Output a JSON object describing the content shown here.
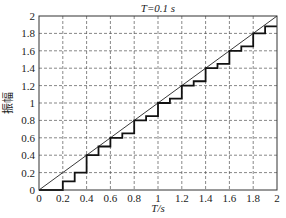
{
  "chart_data": {
    "type": "line",
    "title": "T=0.1 s",
    "xlabel": "T/s",
    "ylabel": "振幅",
    "xlim": [
      0,
      2
    ],
    "ylim": [
      0,
      2
    ],
    "grid": true,
    "x_ticks": [
      "0",
      "0.2",
      "0.4",
      "0.6",
      "0.8",
      "1",
      "1.2",
      "1.4",
      "1.6",
      "1.8",
      "2"
    ],
    "y_ticks": [
      "0",
      "0.2",
      "0.4",
      "0.6",
      "0.8",
      "1",
      "1.2",
      "1.4",
      "1.6",
      "1.8",
      "2"
    ],
    "series": [
      {
        "name": "input (ramp)",
        "style": "thin line",
        "x": [
          0,
          2
        ],
        "y": [
          0,
          2
        ]
      },
      {
        "name": "sampled output (staircase)",
        "style": "thick step",
        "x": [
          0,
          0.2,
          0.3,
          0.4,
          0.5,
          0.6,
          0.7,
          0.8,
          0.9,
          1.0,
          1.1,
          1.2,
          1.3,
          1.4,
          1.5,
          1.6,
          1.7,
          1.8,
          1.9,
          2.0
        ],
        "y": [
          0,
          0.1,
          0.2,
          0.4,
          0.5,
          0.6,
          0.65,
          0.8,
          0.85,
          1.0,
          1.05,
          1.2,
          1.25,
          1.4,
          1.45,
          1.6,
          1.65,
          1.8,
          1.88,
          1.88
        ]
      }
    ]
  }
}
